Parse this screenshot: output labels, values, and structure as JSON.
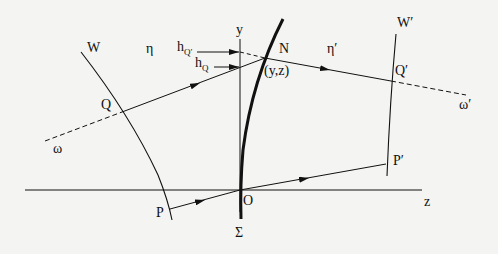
{
  "diagram": {
    "type": "optics-wavefront-refraction",
    "labels": {
      "W": "W",
      "W_prime": "W′",
      "eta": "η",
      "eta_prime": "η′",
      "h": "h",
      "h_Q_sub": "Q",
      "h_Q_prime_sub": "Q′",
      "y_axis": "y",
      "z_axis": "z",
      "N": "N",
      "point_yz": "(y,z)",
      "Q": "Q",
      "Q_prime": "Q′",
      "omega": "ω",
      "omega_prime": "ω′",
      "P": "P",
      "P_prime": "P′",
      "O": "O",
      "Sigma": "Σ"
    },
    "colors": {
      "ink": "#111111",
      "background": "#f4f4f2"
    }
  }
}
